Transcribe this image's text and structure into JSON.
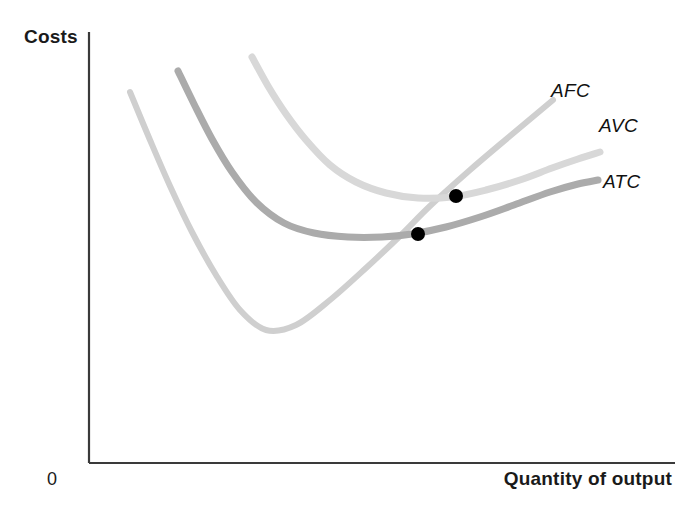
{
  "figure": {
    "background_color": "#ffffff",
    "width": 675,
    "height": 522
  },
  "axes": {
    "y_title": "Costs",
    "x_title": "Quantity of output",
    "origin_label": "0",
    "axis_color": "#3a3a3a",
    "y_axis": {
      "x": 89,
      "y_top": 32,
      "y_bottom": 463
    },
    "x_axis": {
      "y": 463,
      "x_left": 89,
      "x_right": 675
    }
  },
  "curve_labels": [
    {
      "id": "afc",
      "text": "AFC"
    },
    {
      "id": "avc",
      "text": "AVC"
    },
    {
      "id": "atc",
      "text": "ATC"
    }
  ],
  "chart_data": {
    "type": "line",
    "title": "",
    "xlabel": "Quantity of output",
    "ylabel": "Costs",
    "grid": false,
    "legend_position": "inline-right",
    "axis_ranges": {
      "x": [
        89,
        675
      ],
      "y": [
        32,
        463
      ]
    },
    "note": "Average cost curves diagram; y-axis increases upward. Coordinates are pixel positions in the 675x522 image.",
    "series": [
      {
        "name": "AFC",
        "label": "AFC",
        "color": "#cfcfcf",
        "stroke_width": 6,
        "shape": "u-shaped",
        "points": [
          [
            130,
            92
          ],
          [
            150,
            140
          ],
          [
            170,
            186
          ],
          [
            192,
            232
          ],
          [
            216,
            275
          ],
          [
            240,
            310
          ],
          [
            266,
            330
          ],
          [
            296,
            325
          ],
          [
            330,
            300
          ],
          [
            366,
            268
          ],
          [
            400,
            236
          ],
          [
            430,
            206
          ],
          [
            470,
            170
          ],
          [
            510,
            136
          ],
          [
            553,
            100
          ]
        ]
      },
      {
        "name": "AVC",
        "label": "AVC",
        "color": "#d8d8d8",
        "stroke_width": 7,
        "shape": "u-shaped-flat",
        "points": [
          [
            252,
            57
          ],
          [
            268,
            86
          ],
          [
            286,
            114
          ],
          [
            306,
            140
          ],
          [
            330,
            165
          ],
          [
            356,
            182
          ],
          [
            386,
            193
          ],
          [
            418,
            198
          ],
          [
            452,
            197
          ],
          [
            486,
            190
          ],
          [
            520,
            180
          ],
          [
            552,
            168
          ],
          [
            578,
            159
          ],
          [
            600,
            152
          ]
        ]
      },
      {
        "name": "ATC",
        "label": "ATC",
        "color": "#ababab",
        "stroke_width": 7,
        "shape": "u-shaped-flat",
        "points": [
          [
            178,
            71
          ],
          [
            194,
            104
          ],
          [
            212,
            139
          ],
          [
            232,
            172
          ],
          [
            256,
            202
          ],
          [
            284,
            223
          ],
          [
            314,
            233
          ],
          [
            348,
            237
          ],
          [
            382,
            237
          ],
          [
            412,
            234
          ],
          [
            446,
            227
          ],
          [
            480,
            217
          ],
          [
            514,
            205
          ],
          [
            550,
            192
          ],
          [
            578,
            184
          ],
          [
            598,
            180
          ]
        ]
      }
    ],
    "intersection_points": [
      {
        "label": "AFC crosses AVC minimum",
        "x": 456,
        "y": 196,
        "radius": 7,
        "color": "#000000"
      },
      {
        "label": "AFC crosses ATC minimum",
        "x": 418,
        "y": 234,
        "radius": 7,
        "color": "#000000"
      }
    ]
  }
}
